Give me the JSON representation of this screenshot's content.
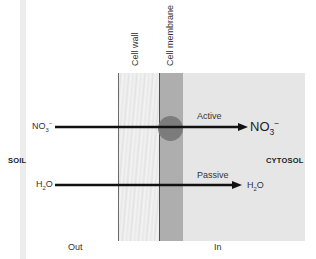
{
  "labels": {
    "cell_wall": "Cell wall",
    "cell_membrane": "Cell membrane",
    "soil": "SOIL",
    "cytosol": "CYTOSOL",
    "out": "Out",
    "in": "In"
  },
  "transport": [
    {
      "type": "Active",
      "ion_left": {
        "base": "NO",
        "sub": "3",
        "sup": "−"
      },
      "ion_right": {
        "base": "NO",
        "sub": "3",
        "sup": "−"
      }
    },
    {
      "type": "Passive",
      "ion_left": {
        "base": "H",
        "sub": "2",
        "rest": "O"
      },
      "ion_right": {
        "base": "H",
        "sub": "2",
        "rest": "O"
      }
    }
  ],
  "colors": {
    "cell_wall": "#eeeeee",
    "cell_membrane": "#aeaeae",
    "cytosol": "#e6e6e6",
    "transport_protein": "#7c7c7c",
    "arrow": "#111111"
  }
}
